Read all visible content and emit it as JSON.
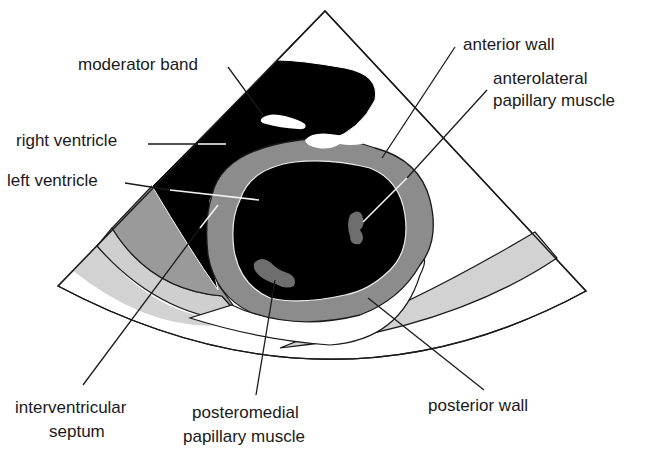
{
  "diagram": {
    "type": "echocardiogram parasternal short-axis view (anatomical schematic)",
    "colors": {
      "background": "#ffffff",
      "cavity": "#000000",
      "myocardium": "#8c8c8c",
      "papillary_muscle": "#6e6e6e",
      "pericardium_band": "#d0d0d0",
      "chest_wall_tissue": "#9a9a9a",
      "outline": "#1a1a1a"
    },
    "labels": {
      "moderator_band": "moderator band",
      "right_ventricle": "right ventricle",
      "left_ventricle": "left ventricle",
      "anterior_wall": "anterior wall",
      "anterolateral_line1": "anterolateral",
      "anterolateral_line2": "papillary muscle",
      "interventricular_line1": "interventricular",
      "interventricular_line2": "septum",
      "posteromedial_line1": "posteromedial",
      "posteromedial_line2": "papillary muscle",
      "posterior_wall": "posterior wall"
    }
  }
}
